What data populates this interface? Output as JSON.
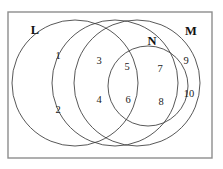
{
  "diagram": {
    "type": "venn",
    "title": "",
    "universe": {
      "name": "universe-rectangle",
      "x": 8,
      "y": 12,
      "width": 204,
      "height": 146,
      "border_color": "#8d8d8d"
    },
    "circle_color": "#3a3a3a",
    "set_labels": [
      {
        "id": "L",
        "text": "L",
        "x": 35,
        "y": 31
      },
      {
        "id": "N",
        "text": "N",
        "x": 152,
        "y": 42
      },
      {
        "id": "M",
        "text": "M",
        "x": 191,
        "y": 32
      }
    ],
    "circles": [
      {
        "id": "circle-L",
        "label": "L",
        "cx": 75,
        "cy": 83,
        "r": 63
      },
      {
        "id": "circle-middle",
        "label": "",
        "cx": 115,
        "cy": 83,
        "r": 63
      },
      {
        "id": "circle-M",
        "label": "M",
        "cx": 137,
        "cy": 83,
        "r": 63
      },
      {
        "id": "circle-N",
        "label": "N",
        "cx": 148,
        "cy": 86,
        "r": 40
      }
    ],
    "regions": [
      {
        "id": "region-1",
        "label": "1",
        "x": 58,
        "y": 57
      },
      {
        "id": "region-2",
        "label": "2",
        "x": 58,
        "y": 111
      },
      {
        "id": "region-3",
        "label": "3",
        "x": 99,
        "y": 62
      },
      {
        "id": "region-4",
        "label": "4",
        "x": 99,
        "y": 101
      },
      {
        "id": "region-5",
        "label": "5",
        "x": 127,
        "y": 68
      },
      {
        "id": "region-6",
        "label": "6",
        "x": 128,
        "y": 101
      },
      {
        "id": "region-7",
        "label": "7",
        "x": 160,
        "y": 70
      },
      {
        "id": "region-8",
        "label": "8",
        "x": 161,
        "y": 103
      },
      {
        "id": "region-9",
        "label": "9",
        "x": 186,
        "y": 62
      },
      {
        "id": "region-10",
        "label": "10",
        "x": 189,
        "y": 95
      }
    ]
  }
}
